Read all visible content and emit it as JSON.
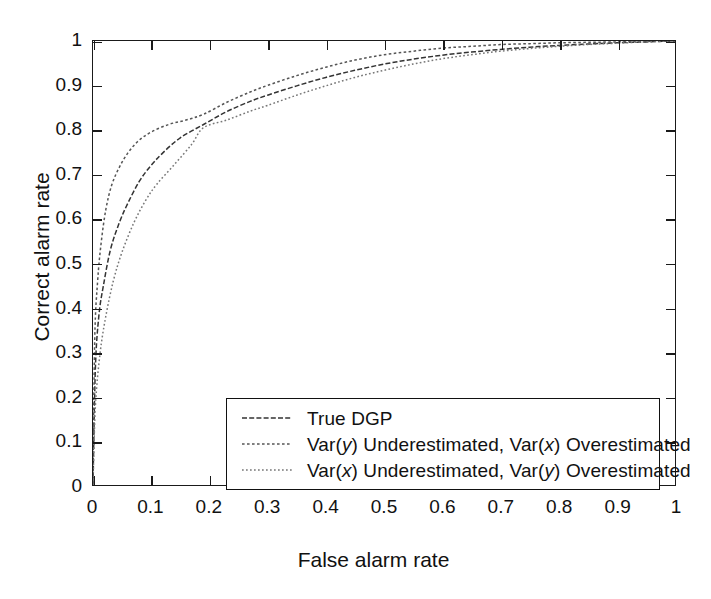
{
  "chart_data": {
    "type": "line",
    "title": "",
    "xlabel": "False alarm rate",
    "ylabel": "Correct alarm rate",
    "xlim": [
      0,
      1
    ],
    "ylim": [
      0,
      1
    ],
    "grid": false,
    "legend_position": "lower right",
    "xticks": [
      "0",
      "0.1",
      "0.2",
      "0.3",
      "0.4",
      "0.5",
      "0.6",
      "0.7",
      "0.8",
      "0.9",
      "1"
    ],
    "yticks": [
      "0",
      "0.1",
      "0.2",
      "0.3",
      "0.4",
      "0.5",
      "0.6",
      "0.7",
      "0.8",
      "0.9",
      "1"
    ],
    "xtick_values": [
      0,
      0.1,
      0.2,
      0.3,
      0.4,
      0.5,
      0.6,
      0.7,
      0.8,
      0.9,
      1
    ],
    "ytick_values": [
      0,
      0.1,
      0.2,
      0.3,
      0.4,
      0.5,
      0.6,
      0.7,
      0.8,
      0.9,
      1
    ],
    "crossover_point": {
      "x": 0.19,
      "y": 0.81
    },
    "series": [
      {
        "name": "True DGP",
        "label_plain": "True DGP",
        "style": "dashed-dotted",
        "color": "#333333",
        "x": [
          0,
          0.004,
          0.01,
          0.018,
          0.03,
          0.045,
          0.06,
          0.08,
          0.1,
          0.12,
          0.15,
          0.19,
          0.23,
          0.27,
          0.3,
          0.35,
          0.4,
          0.45,
          0.5,
          0.55,
          0.6,
          0.65,
          0.7,
          0.75,
          0.8,
          0.85,
          0.9,
          0.95,
          1
        ],
        "y": [
          0,
          0.26,
          0.38,
          0.45,
          0.53,
          0.59,
          0.635,
          0.685,
          0.72,
          0.748,
          0.782,
          0.812,
          0.841,
          0.864,
          0.878,
          0.899,
          0.918,
          0.934,
          0.948,
          0.959,
          0.968,
          0.975,
          0.981,
          0.986,
          0.99,
          0.993,
          0.996,
          0.998,
          1
        ]
      },
      {
        "name": "Var(y) Underestimated, Var(x) Overestimated",
        "label_parts": [
          "Var(",
          "y",
          ") Underestimated, Var(",
          "x",
          ") Overestimated"
        ],
        "style": "dotted",
        "color": "#555555",
        "x": [
          0,
          0.003,
          0.008,
          0.014,
          0.022,
          0.032,
          0.045,
          0.06,
          0.078,
          0.1,
          0.13,
          0.16,
          0.19,
          0.23,
          0.27,
          0.3,
          0.35,
          0.4,
          0.45,
          0.5,
          0.55,
          0.6,
          0.65,
          0.7,
          0.75,
          0.8,
          0.85,
          0.9,
          0.95,
          1
        ],
        "y": [
          0,
          0.33,
          0.46,
          0.545,
          0.62,
          0.675,
          0.715,
          0.748,
          0.775,
          0.795,
          0.812,
          0.822,
          0.835,
          0.862,
          0.885,
          0.9,
          0.922,
          0.941,
          0.957,
          0.969,
          0.977,
          0.984,
          0.988,
          0.992,
          0.994,
          0.996,
          0.997,
          0.998,
          0.999,
          1
        ]
      },
      {
        "name": "Var(x) Underestimated, Var(y) Overestimated",
        "label_parts": [
          "Var(",
          "x",
          ") Underestimated, Var(",
          "y",
          ") Overestimated"
        ],
        "style": "fine-dotted",
        "color": "#777777",
        "x": [
          0,
          0.004,
          0.012,
          0.022,
          0.035,
          0.05,
          0.07,
          0.09,
          0.11,
          0.14,
          0.17,
          0.19,
          0.23,
          0.27,
          0.3,
          0.35,
          0.4,
          0.45,
          0.5,
          0.55,
          0.6,
          0.65,
          0.7,
          0.75,
          0.8,
          0.85,
          0.9,
          0.95,
          1
        ],
        "y": [
          0,
          0.175,
          0.295,
          0.38,
          0.46,
          0.525,
          0.59,
          0.64,
          0.678,
          0.722,
          0.768,
          0.805,
          0.822,
          0.842,
          0.855,
          0.878,
          0.899,
          0.918,
          0.934,
          0.948,
          0.96,
          0.969,
          0.977,
          0.983,
          0.988,
          0.992,
          0.995,
          0.998,
          1
        ]
      }
    ]
  },
  "legend": {
    "items": [
      {
        "text": "True DGP"
      },
      {
        "text": "Var(y) Underestimated, Var(x) Overestimated"
      },
      {
        "text": "Var(x) Underestimated, Var(y) Overestimated"
      }
    ]
  }
}
